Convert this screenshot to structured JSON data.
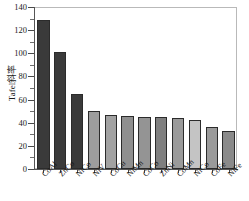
{
  "chart_data": {
    "type": "bar",
    "title": "",
    "xlabel": "",
    "ylabel": "Tafel斜率",
    "ylim": [
      0,
      140
    ],
    "yticks": [
      0,
      20,
      40,
      60,
      80,
      100,
      120,
      140
    ],
    "ytick_labels": [
      "0",
      "20",
      "40",
      "60",
      "80",
      "100",
      "120",
      "140"
    ],
    "grid": false,
    "legend": "none",
    "categories": [
      "CoAl",
      "ZnCo",
      "NiCo",
      "NiV",
      "CoCu",
      "NiMn",
      "CoCo",
      "ZnNi",
      "CoMn",
      "NiCo",
      "CoFe",
      "NiFe"
    ],
    "values": [
      129,
      101,
      65,
      50,
      47,
      46,
      45,
      45,
      44,
      42,
      36,
      33
    ],
    "bar_colors": [
      "#3a3a3a",
      "#3a3a3a",
      "#3a3a3a",
      "#9d9d9d",
      "#a2a2a2",
      "#8f8f8f",
      "#949494",
      "#7f7f7f",
      "#9a9a9a",
      "#c4c4c4",
      "#9a9a9a",
      "#8a8a8a"
    ],
    "series": [
      {
        "name": "Tafel斜率",
        "values": [
          129,
          101,
          65,
          50,
          47,
          46,
          45,
          45,
          44,
          42,
          36,
          33
        ]
      }
    ]
  },
  "axis": {
    "y_title": "Tafel斜率",
    "y_max_label": "140",
    "y_min_label": "0"
  }
}
